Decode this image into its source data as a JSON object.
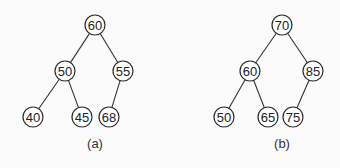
{
  "diagram": {
    "type": "binary-tree-pair",
    "trees": [
      {
        "id": "a",
        "caption": "(a)",
        "caption_pos": {
          "x": 95,
          "y": 143
        },
        "nodes": [
          {
            "id": "a60",
            "label": "60",
            "x": 95,
            "y": 25
          },
          {
            "id": "a50",
            "label": "50",
            "x": 65,
            "y": 71
          },
          {
            "id": "a55",
            "label": "55",
            "x": 123,
            "y": 71
          },
          {
            "id": "a40",
            "label": "40",
            "x": 33,
            "y": 117
          },
          {
            "id": "a45",
            "label": "45",
            "x": 82,
            "y": 117
          },
          {
            "id": "a68",
            "label": "68",
            "x": 109,
            "y": 117
          }
        ],
        "edges": [
          [
            "a60",
            "a50"
          ],
          [
            "a60",
            "a55"
          ],
          [
            "a50",
            "a40"
          ],
          [
            "a50",
            "a45"
          ],
          [
            "a55",
            "a68"
          ]
        ]
      },
      {
        "id": "b",
        "caption": "(b)",
        "caption_pos": {
          "x": 282,
          "y": 143
        },
        "nodes": [
          {
            "id": "b70",
            "label": "70",
            "x": 282,
            "y": 25
          },
          {
            "id": "b60",
            "label": "60",
            "x": 250,
            "y": 71
          },
          {
            "id": "b85",
            "label": "85",
            "x": 313,
            "y": 71
          },
          {
            "id": "b50",
            "label": "50",
            "x": 224,
            "y": 117
          },
          {
            "id": "b65",
            "label": "65",
            "x": 268,
            "y": 117
          },
          {
            "id": "b75",
            "label": "75",
            "x": 293,
            "y": 117
          }
        ],
        "edges": [
          [
            "b70",
            "b60"
          ],
          [
            "b70",
            "b85"
          ],
          [
            "b60",
            "b50"
          ],
          [
            "b60",
            "b65"
          ],
          [
            "b85",
            "b75"
          ]
        ]
      }
    ],
    "node_radius": 10,
    "colors": {
      "background": "#fbfbfb",
      "stroke": "#2a2a2a",
      "node_fill": "#ffffff",
      "text": "#222222"
    }
  }
}
